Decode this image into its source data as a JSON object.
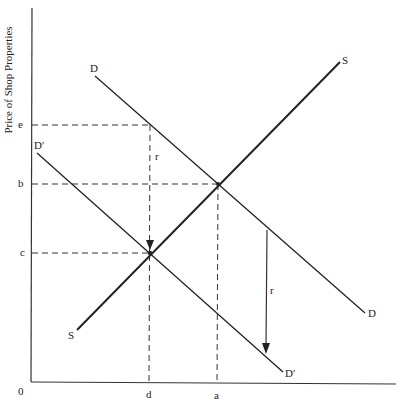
{
  "diagram": {
    "y_axis_label": "Price of Shop Properties",
    "origin_label": "0",
    "y_ticks": [
      {
        "label": "e",
        "y": 125
      },
      {
        "label": "b",
        "y": 184
      },
      {
        "label": "c",
        "y": 253
      }
    ],
    "x_ticks": [
      {
        "label": "d",
        "x": 150
      },
      {
        "label": "a",
        "x": 218
      }
    ],
    "curves": {
      "supply": {
        "label_start": "S",
        "label_end": "S"
      },
      "demand": {
        "label_start": "D",
        "label_end": "D"
      },
      "demand_shifted": {
        "label_start": "D′",
        "label_end": "D′"
      }
    },
    "shift_labels": {
      "left": "r",
      "right": "r"
    },
    "colors": {
      "line": "#222222",
      "background": "#ffffff"
    }
  }
}
